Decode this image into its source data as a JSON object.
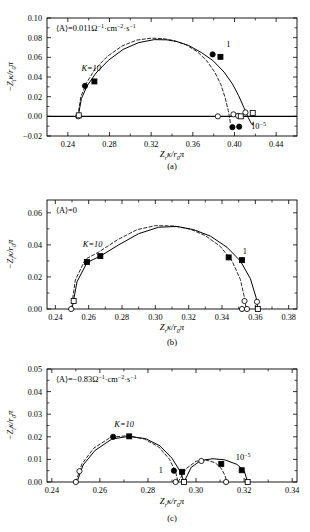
{
  "figure": {
    "type": "multi-panel-nyquist-figure",
    "panel_count": 3
  },
  "panels": {
    "a": {
      "caption": "(a)",
      "annotation": "⟨A⟩=0.011Ω−1·cm−2·s−1",
      "annotation_parts": {
        "lead": "⟨A⟩=0.011Ω",
        "exp1": "−1",
        "mid": "·cm",
        "exp2": "−2",
        "tail": "·s",
        "exp3": "−1"
      },
      "label_k10": "K=10",
      "label_one": "1",
      "label_low": {
        "base": "10",
        "exp": "−5"
      },
      "xlabel_parts": {
        "z": "Z",
        "sub": "r",
        "kappa": "κ/r",
        "sub0": "0",
        "pi": "π"
      },
      "ylabel_parts": {
        "minus": "−Z",
        "sub": "i",
        "kappa": "κ/r",
        "sub0": "0",
        "pi": "π"
      },
      "xticks": [
        "0.24",
        "0.28",
        "0.32",
        "0.36",
        "0.40",
        "0.44"
      ],
      "yticks": [
        "−0.02",
        "0.00",
        "0.02",
        "0.04",
        "0.06",
        "0.08",
        "0.10"
      ]
    },
    "b": {
      "caption": "(b)",
      "annotation": "⟨A⟩=0",
      "annotation_parts": {
        "lead": "⟨A⟩=0",
        "exp1": "",
        "mid": "",
        "exp2": "",
        "tail": "",
        "exp3": ""
      },
      "label_k10": "K=10",
      "label_one": "1",
      "xlabel_parts": {
        "z": "Z",
        "sub": "r",
        "kappa": "κ/r",
        "sub0": "0",
        "pi": "π"
      },
      "ylabel_parts": {
        "minus": "−Z",
        "sub": "i",
        "kappa": "κ/r",
        "sub0": "0",
        "pi": "π"
      },
      "xticks": [
        "0.24",
        "0.26",
        "0.28",
        "0.30",
        "0.32",
        "0.34",
        "0.36",
        "0.38"
      ],
      "yticks": [
        "0.00",
        "0.02",
        "0.04",
        "0.06"
      ]
    },
    "c": {
      "caption": "(c)",
      "annotation": "⟨A⟩=−0.83Ω−1·cm−2·s−1",
      "annotation_parts": {
        "lead": "⟨A⟩=−0.83Ω",
        "exp1": "−1",
        "mid": "·cm",
        "exp2": "−2",
        "tail": "·s",
        "exp3": "−1"
      },
      "label_k10": "K=10",
      "label_one": "1",
      "label_low": {
        "base": "10",
        "exp": "−5"
      },
      "xlabel_parts": {
        "z": "Z",
        "sub": "r",
        "kappa": "κ/r",
        "sub0": "0",
        "pi": "π"
      },
      "ylabel_parts": {
        "minus": "−Z",
        "sub": "i",
        "kappa": "κ/r",
        "sub0": "0",
        "pi": "π"
      },
      "xticks": [
        "0.24",
        "0.26",
        "0.28",
        "0.30",
        "0.32",
        "0.34"
      ],
      "yticks": [
        "0.00",
        "0.01",
        "0.02",
        "0.03",
        "0.04",
        "0.05"
      ]
    }
  },
  "chart_data": [
    {
      "panel": "a",
      "type": "scatter",
      "title": "",
      "annotation": "⟨A⟩=0.011Ω⁻¹·cm⁻²·s⁻¹",
      "xlabel": "Z_rκ/r₀π",
      "ylabel": "−Z_iκ/r₀π",
      "xlim": [
        0.22,
        0.46
      ],
      "ylim": [
        -0.02,
        0.1
      ],
      "grid": false,
      "legend": "none",
      "annotations": [
        {
          "text": "K=10",
          "x": 0.253,
          "y": 0.046
        },
        {
          "text": "1",
          "x": 0.392,
          "y": 0.071
        },
        {
          "text": "10⁻⁵",
          "x": 0.416,
          "y": -0.013
        }
      ],
      "series": [
        {
          "name": "solid-curve",
          "style": "solid",
          "x": [
            0.25,
            0.253,
            0.2585,
            0.267,
            0.279,
            0.293,
            0.308,
            0.323,
            0.335,
            0.345,
            0.356,
            0.368,
            0.379,
            0.39,
            0.398,
            0.404,
            0.409,
            0.413,
            0.416,
            0.4175,
            0.418
          ],
          "y": [
            0.0,
            0.018,
            0.031,
            0.044,
            0.057,
            0.068,
            0.075,
            0.078,
            0.0778,
            0.076,
            0.072,
            0.065,
            0.057,
            0.045,
            0.033,
            0.021,
            0.009,
            -0.001,
            -0.007,
            -0.009,
            -0.006
          ]
        },
        {
          "name": "dashed-curve",
          "style": "dashed",
          "x": [
            0.2495,
            0.2525,
            0.258,
            0.266,
            0.278,
            0.292,
            0.306,
            0.32,
            0.332,
            0.342,
            0.353,
            0.364,
            0.373,
            0.381,
            0.387,
            0.391,
            0.394,
            0.3955,
            0.396
          ],
          "y": [
            0.0,
            0.02,
            0.034,
            0.048,
            0.061,
            0.0715,
            0.0775,
            0.0795,
            0.079,
            0.077,
            0.073,
            0.066,
            0.057,
            0.045,
            0.032,
            0.019,
            0.006,
            -0.003,
            -0.007
          ]
        }
      ],
      "markers": [
        {
          "marker": "open-circle",
          "x": 0.25,
          "y": 0.0
        },
        {
          "marker": "open-square",
          "x": 0.2505,
          "y": 0.001
        },
        {
          "marker": "filled-circle",
          "x": 0.2565,
          "y": 0.031
        },
        {
          "marker": "filled-square",
          "x": 0.2655,
          "y": 0.0355
        },
        {
          "marker": "filled-circle",
          "x": 0.379,
          "y": 0.063
        },
        {
          "marker": "filled-square",
          "x": 0.3865,
          "y": 0.0605
        },
        {
          "marker": "open-circle",
          "x": 0.384,
          "y": 0.0
        },
        {
          "marker": "open-circle",
          "x": 0.399,
          "y": 0.002
        },
        {
          "marker": "open-circle",
          "x": 0.4035,
          "y": 0.0005
        },
        {
          "marker": "open-circle",
          "x": 0.4105,
          "y": 0.004
        },
        {
          "marker": "open-square",
          "x": 0.4175,
          "y": 0.0035
        },
        {
          "marker": "open-square",
          "x": 0.406,
          "y": 0.0
        },
        {
          "marker": "filled-circle",
          "x": 0.398,
          "y": -0.011
        },
        {
          "marker": "filled-circle",
          "x": 0.4045,
          "y": -0.0105
        }
      ]
    },
    {
      "panel": "b",
      "type": "scatter",
      "title": "",
      "annotation": "⟨A⟩=0",
      "xlabel": "Z_rκ/r₀π",
      "ylabel": "−Z_iκ/r₀π",
      "xlim": [
        0.235,
        0.385
      ],
      "ylim": [
        0.0,
        0.068
      ],
      "grid": false,
      "legend": "none",
      "annotations": [
        {
          "text": "K=10",
          "x": 0.2565,
          "y": 0.0385
        },
        {
          "text": "1",
          "x": 0.3525,
          "y": 0.0345
        }
      ],
      "series": [
        {
          "name": "solid-curve",
          "style": "solid",
          "x": [
            0.25,
            0.253,
            0.259,
            0.267,
            0.278,
            0.29,
            0.302,
            0.313,
            0.323,
            0.333,
            0.343,
            0.351,
            0.357,
            0.3605,
            0.3615
          ],
          "y": [
            0.0,
            0.017,
            0.029,
            0.033,
            0.04,
            0.047,
            0.051,
            0.0515,
            0.0495,
            0.0455,
            0.0385,
            0.03,
            0.019,
            0.007,
            0.0
          ]
        },
        {
          "name": "dashed-curve",
          "style": "dashed",
          "x": [
            0.2495,
            0.252,
            0.258,
            0.266,
            0.277,
            0.289,
            0.3,
            0.311,
            0.321,
            0.33,
            0.339,
            0.346,
            0.351,
            0.3535,
            0.3545
          ],
          "y": [
            0.0,
            0.018,
            0.031,
            0.0355,
            0.043,
            0.0495,
            0.052,
            0.0518,
            0.0498,
            0.0458,
            0.039,
            0.03,
            0.0185,
            0.007,
            0.0
          ]
        }
      ],
      "markers": [
        {
          "marker": "open-circle",
          "x": 0.2495,
          "y": 0.0
        },
        {
          "marker": "open-square",
          "x": 0.251,
          "y": 0.005
        },
        {
          "marker": "filled-square",
          "x": 0.259,
          "y": 0.0293
        },
        {
          "marker": "filled-square",
          "x": 0.267,
          "y": 0.033
        },
        {
          "marker": "filled-square",
          "x": 0.344,
          "y": 0.0322
        },
        {
          "marker": "filled-square",
          "x": 0.352,
          "y": 0.0305
        },
        {
          "marker": "open-circle",
          "x": 0.3535,
          "y": 0.005
        },
        {
          "marker": "open-circle",
          "x": 0.352,
          "y": 0.0
        },
        {
          "marker": "open-circle",
          "x": 0.355,
          "y": 0.0
        },
        {
          "marker": "open-circle",
          "x": 0.361,
          "y": 0.0045
        },
        {
          "marker": "open-square",
          "x": 0.3615,
          "y": 0.0
        }
      ]
    },
    {
      "panel": "c",
      "type": "scatter",
      "title": "",
      "annotation": "⟨A⟩=−0.83Ω⁻¹·cm⁻²·s⁻¹",
      "xlabel": "Z_rκ/r₀π",
      "ylabel": "−Z_iκ/r₀π",
      "xlim": [
        0.238,
        0.342
      ],
      "ylim": [
        0.0,
        0.05
      ],
      "grid": false,
      "legend": "none",
      "annotations": [
        {
          "text": "K=10",
          "x": 0.266,
          "y": 0.0245
        },
        {
          "text": "1",
          "x": 0.2845,
          "y": 0.0042
        },
        {
          "text": "10⁻⁵",
          "x": 0.3165,
          "y": 0.0098
        }
      ],
      "series": [
        {
          "name": "solid-curve-arc1",
          "style": "solid",
          "x": [
            0.2505,
            0.253,
            0.258,
            0.265,
            0.272,
            0.279,
            0.285,
            0.29,
            0.2935,
            0.295
          ],
          "y": [
            0.0,
            0.0075,
            0.014,
            0.019,
            0.0202,
            0.0192,
            0.016,
            0.0105,
            0.0045,
            0.0
          ]
        },
        {
          "name": "dashed-curve-arc1",
          "style": "dashed",
          "x": [
            0.25,
            0.2525,
            0.2575,
            0.2645,
            0.2715,
            0.2785,
            0.2845,
            0.289,
            0.2915,
            0.2925
          ],
          "y": [
            0.0,
            0.008,
            0.015,
            0.0198,
            0.0205,
            0.019,
            0.0155,
            0.01,
            0.0045,
            0.0
          ]
        },
        {
          "name": "solid-curve-arc2",
          "style": "solid",
          "x": [
            0.295,
            0.298,
            0.302,
            0.307,
            0.312,
            0.317,
            0.32,
            0.3215
          ],
          "y": [
            0.0,
            0.0065,
            0.0095,
            0.0103,
            0.0098,
            0.0078,
            0.005,
            0.0
          ]
        },
        {
          "name": "dashed-curve-arc2",
          "style": "dashed",
          "x": [
            0.2925,
            0.296,
            0.3,
            0.304,
            0.308,
            0.3105,
            0.312,
            0.3128
          ],
          "y": [
            0.0,
            0.006,
            0.0092,
            0.0098,
            0.0085,
            0.006,
            0.003,
            0.0
          ]
        }
      ],
      "markers": [
        {
          "marker": "open-circle",
          "x": 0.25,
          "y": 0.0
        },
        {
          "marker": "open-circle",
          "x": 0.2515,
          "y": 0.0048
        },
        {
          "marker": "filled-circle",
          "x": 0.2655,
          "y": 0.02
        },
        {
          "marker": "filled-square",
          "x": 0.2722,
          "y": 0.0202
        },
        {
          "marker": "filled-circle",
          "x": 0.2908,
          "y": 0.005
        },
        {
          "marker": "filled-square",
          "x": 0.2942,
          "y": 0.0045
        },
        {
          "marker": "open-circle",
          "x": 0.2915,
          "y": 0.0
        },
        {
          "marker": "open-square",
          "x": 0.295,
          "y": 0.0
        },
        {
          "marker": "open-circle",
          "x": 0.3022,
          "y": 0.0093
        },
        {
          "marker": "filled-square",
          "x": 0.3105,
          "y": 0.008
        },
        {
          "marker": "filled-square",
          "x": 0.319,
          "y": 0.0052
        },
        {
          "marker": "open-circle",
          "x": 0.3125,
          "y": 0.0
        },
        {
          "marker": "open-square",
          "x": 0.3215,
          "y": 0.0
        }
      ]
    }
  ]
}
